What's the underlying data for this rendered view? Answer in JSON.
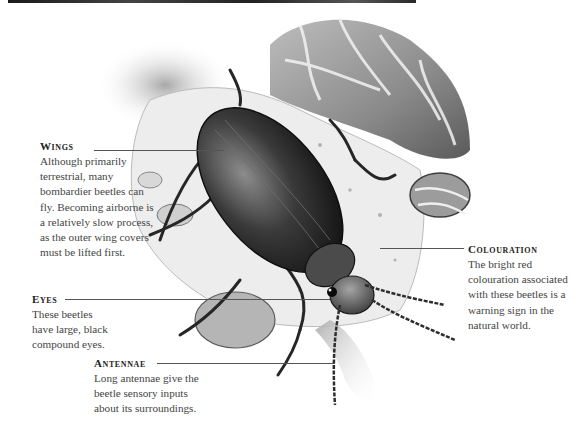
{
  "callouts": {
    "wings": {
      "title": "Wings",
      "body": [
        "Although primarily",
        "terrestrial, many",
        "bombardier beetles can",
        "fly. Becoming airborne is",
        "a relatively slow process,",
        "as the outer wing covers",
        "must be lifted first."
      ]
    },
    "eyes": {
      "title": "Eyes",
      "body": [
        "These beetles",
        "have large, black",
        "compound eyes."
      ]
    },
    "antennae": {
      "title": "Antennae",
      "body": [
        "Long antennae give the",
        "beetle sensory inputs",
        "about its surroundings."
      ]
    },
    "colouration": {
      "title": "Colouration",
      "body": [
        "The bright red",
        "colouration associated",
        "with these beetles is a",
        "warning sign in the",
        "natural world."
      ]
    }
  },
  "illustration": {
    "subject": "bombardier beetle on rocks",
    "palette": {
      "dark": "#1e1e1e",
      "mid": "#6a6a6a",
      "light": "#c8c8c8",
      "paper": "#ffffff"
    }
  }
}
